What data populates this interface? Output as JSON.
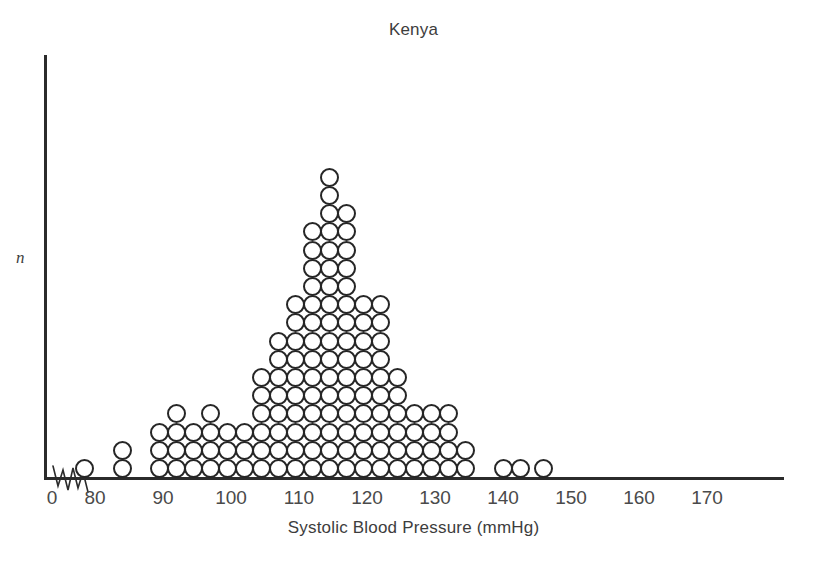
{
  "chart": {
    "title": "Kenya",
    "xlabel": "Systolic Blood Pressure (mmHg)",
    "ylabel": "n",
    "axis_break_icon": "axis-break-squiggle"
  },
  "chart_data": {
    "type": "bar",
    "subtype": "dot-plot",
    "title": "Kenya",
    "xlabel": "Systolic Blood Pressure (mmHg)",
    "ylabel": "n",
    "xlim": [
      70,
      175
    ],
    "ylim": [
      0,
      17
    ],
    "grid": false,
    "legend": null,
    "axis_break_on_x": true,
    "xticks": [
      0,
      80,
      90,
      100,
      110,
      120,
      130,
      140,
      150,
      160,
      170
    ],
    "xtick_labels": [
      "0",
      "80",
      "90",
      "100",
      "110",
      "120",
      "130",
      "140",
      "150",
      "160",
      "170"
    ],
    "bin_width_mmhg": 2.7,
    "dot_unit": 1,
    "categories": [
      78.5,
      84,
      89.5,
      92,
      94.5,
      97,
      99.5,
      102,
      104.5,
      107,
      109.5,
      112,
      114.5,
      117,
      119.5,
      122,
      124.5,
      127,
      129.5,
      132,
      134.5,
      140,
      142.5,
      146
    ],
    "values": [
      1,
      2,
      3,
      4,
      3,
      4,
      3,
      3,
      6,
      8,
      10,
      14,
      17,
      15,
      10,
      10,
      6,
      4,
      4,
      4,
      2,
      1,
      1,
      1
    ],
    "annotations": []
  }
}
